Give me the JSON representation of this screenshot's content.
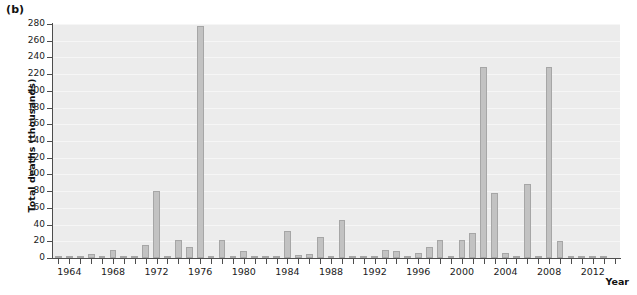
{
  "panel": {
    "label": "(b)"
  },
  "axes": {
    "ylabel": "Total deaths (thousands)",
    "xlabel": "Year",
    "yticks": [
      0,
      20,
      40,
      60,
      80,
      100,
      120,
      140,
      160,
      180,
      200,
      220,
      240,
      260,
      280
    ],
    "xticks": [
      1964,
      1968,
      1972,
      1976,
      1980,
      1984,
      1988,
      1992,
      1996,
      2000,
      2004,
      2008,
      2012
    ]
  },
  "colors": {
    "bar_fill": "#c2c2c2",
    "bar_stroke": "#a6a6a6",
    "plot_background": "#ececec",
    "gridline": "#f6f6f6",
    "axis": "#4d4d4d",
    "text": "#1a1a1a"
  },
  "chart_data": {
    "type": "bar",
    "title": "",
    "subtitle": "",
    "xlabel": "Year",
    "ylabel": "Total deaths (thousands)",
    "xlim": [
      1962.5,
      2014.5
    ],
    "ylim": [
      0,
      280
    ],
    "grid": true,
    "legend": null,
    "series_name": "Total deaths (thousands)",
    "categories": [
      1963,
      1964,
      1965,
      1966,
      1967,
      1968,
      1969,
      1970,
      1971,
      1972,
      1973,
      1974,
      1975,
      1976,
      1977,
      1978,
      1979,
      1980,
      1981,
      1982,
      1983,
      1984,
      1985,
      1986,
      1987,
      1988,
      1989,
      1990,
      1991,
      1992,
      1993,
      1994,
      1995,
      1996,
      1997,
      1998,
      1999,
      2000,
      2001,
      2002,
      2003,
      2004,
      2005,
      2006,
      2007,
      2008,
      2009,
      2010,
      2011,
      2012,
      2013
    ],
    "values": [
      1,
      1,
      2,
      5,
      1,
      10,
      2,
      1,
      16,
      80,
      2,
      22,
      13,
      278,
      2,
      22,
      2,
      8,
      3,
      2,
      2,
      32,
      4,
      5,
      25,
      2,
      45,
      3,
      2,
      3,
      10,
      8,
      2,
      6,
      13,
      22,
      2,
      22,
      30,
      228,
      78,
      6,
      1,
      88,
      1,
      228,
      20,
      2,
      2,
      1,
      1
    ]
  }
}
